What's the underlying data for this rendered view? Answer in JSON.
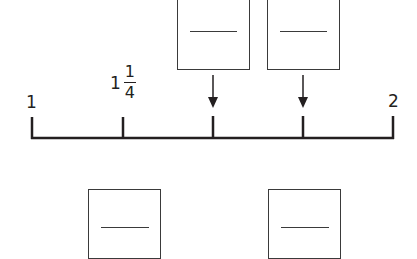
{
  "number_line": {
    "start_label": "1",
    "end_label": "2",
    "labeled_tick": {
      "whole": "1",
      "numerator": "1",
      "denominator": "4"
    },
    "tick_count": 5,
    "color": "#231f20"
  },
  "answer_boxes": {
    "top": [
      {
        "id": "box-top-1",
        "points_to_tick": 3
      },
      {
        "id": "box-top-2",
        "points_to_tick": 4
      }
    ],
    "bottom": [
      {
        "id": "box-bottom-1"
      },
      {
        "id": "box-bottom-2"
      }
    ]
  }
}
